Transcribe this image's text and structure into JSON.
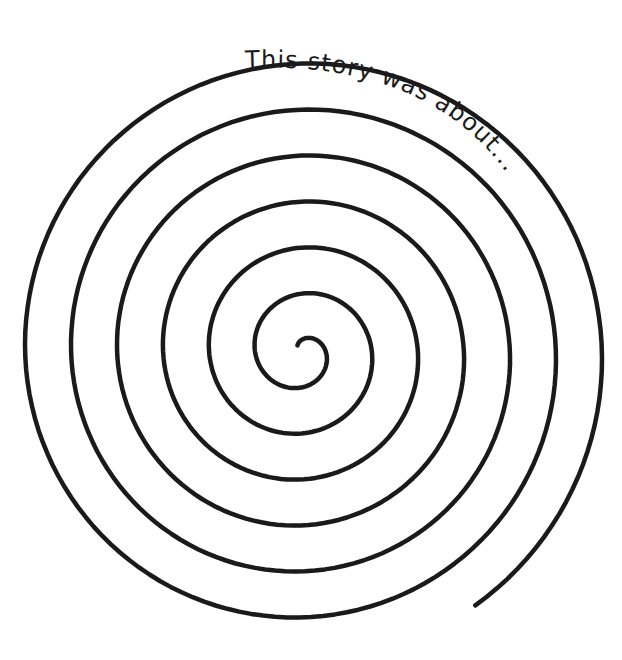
{
  "worksheet": {
    "caption": "This story was about...",
    "ink_color": "#1a1a1a",
    "background_color": "#ffffff",
    "spiral": {
      "turns": 6.5,
      "direction": "clockwise-outward"
    }
  }
}
